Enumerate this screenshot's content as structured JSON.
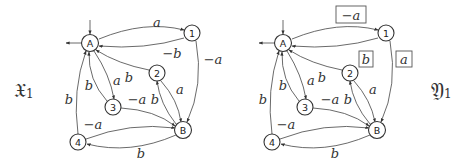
{
  "diagrams": [
    {
      "id": "X1",
      "title": "𝔛",
      "subscript": "1",
      "offset_x": 0,
      "nodes": [
        {
          "id": "A",
          "label": "A",
          "x": 90,
          "y": 43
        },
        {
          "id": "1",
          "label": "1",
          "x": 192,
          "y": 33
        },
        {
          "id": "2",
          "label": "2",
          "x": 157,
          "y": 73
        },
        {
          "id": "3",
          "label": "3",
          "x": 113,
          "y": 107
        },
        {
          "id": "4",
          "label": "4",
          "x": 78,
          "y": 142
        },
        {
          "id": "B",
          "label": "B",
          "x": 183,
          "y": 130
        }
      ],
      "edges": [
        {
          "from": "A",
          "to": "1",
          "label": "a",
          "boxed": false
        },
        {
          "from": "1",
          "to": "A",
          "label": "−b",
          "boxed": false
        },
        {
          "from": "1",
          "to": "B",
          "label": "−a",
          "boxed": false
        },
        {
          "from": "2",
          "to": "A",
          "label": "b",
          "boxed": false
        },
        {
          "from": "2",
          "to": "B",
          "label": "a",
          "boxed": false
        },
        {
          "from": "B",
          "to": "2",
          "label": "b",
          "boxed": false
        },
        {
          "from": "A",
          "to": "3",
          "label": "a",
          "boxed": false
        },
        {
          "from": "3",
          "to": "A",
          "label": "b",
          "boxed": false
        },
        {
          "from": "3",
          "to": "B",
          "label": "−a",
          "boxed": false
        },
        {
          "from": "4",
          "to": "A",
          "label": "b",
          "boxed": false
        },
        {
          "from": "4",
          "to": "B",
          "label": "−a",
          "boxed": false
        },
        {
          "from": "B",
          "to": "4",
          "label": "b",
          "boxed": false
        }
      ]
    },
    {
      "id": "Y1",
      "title": "𝔜",
      "subscript": "1",
      "offset_x": 0,
      "nodes": [
        {
          "id": "A",
          "label": "A",
          "x": 283,
          "y": 43
        },
        {
          "id": "1",
          "label": "1",
          "x": 386,
          "y": 33
        },
        {
          "id": "2",
          "label": "2",
          "x": 350,
          "y": 73
        },
        {
          "id": "3",
          "label": "3",
          "x": 305,
          "y": 107
        },
        {
          "id": "4",
          "label": "4",
          "x": 272,
          "y": 142
        },
        {
          "id": "B",
          "label": "B",
          "x": 377,
          "y": 130
        }
      ],
      "edges": [
        {
          "from": "A",
          "to": "1",
          "label": "−a",
          "boxed": true
        },
        {
          "from": "1",
          "to": "A",
          "label": "b",
          "boxed": true
        },
        {
          "from": "1",
          "to": "B",
          "label": "a",
          "boxed": true
        },
        {
          "from": "2",
          "to": "A",
          "label": "b",
          "boxed": false
        },
        {
          "from": "2",
          "to": "B",
          "label": "a",
          "boxed": false
        },
        {
          "from": "B",
          "to": "2",
          "label": "b",
          "boxed": false
        },
        {
          "from": "A",
          "to": "3",
          "label": "a",
          "boxed": false
        },
        {
          "from": "3",
          "to": "A",
          "label": "b",
          "boxed": false
        },
        {
          "from": "3",
          "to": "B",
          "label": "−a",
          "boxed": false
        },
        {
          "from": "4",
          "to": "A",
          "label": "b",
          "boxed": false
        },
        {
          "from": "4",
          "to": "B",
          "label": "−a",
          "boxed": false
        },
        {
          "from": "B",
          "to": "4",
          "label": "b",
          "boxed": false
        }
      ]
    }
  ],
  "labels": {
    "left_title": "𝔛",
    "left_sub": "1",
    "right_title": "𝔜",
    "right_sub": "1"
  },
  "colors": {
    "stroke": "#444444",
    "text": "#333333",
    "background": "#ffffff"
  }
}
